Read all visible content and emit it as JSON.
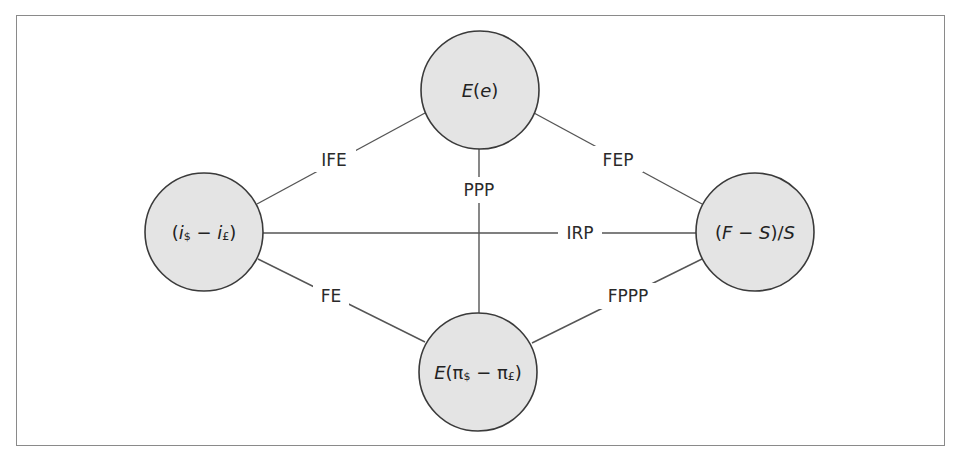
{
  "diagram": {
    "nodes": {
      "top": {
        "label": "E(e)",
        "parts": {
          "func": "E",
          "open": "(",
          "var": "e",
          "close": ")"
        }
      },
      "left": {
        "label": "(i$ − i£)",
        "parts": {
          "open": "(",
          "var1": "i",
          "sub1": "$",
          "minus": " − ",
          "var2": "i",
          "sub2": "£",
          "close": ")"
        }
      },
      "right": {
        "label": "(F − S)/S",
        "parts": {
          "open": "(",
          "var1": "F",
          "minus": " − ",
          "var2": "S",
          "close": ")/",
          "var3": "S"
        }
      },
      "bottom": {
        "label": "E(π$ − π£)",
        "parts": {
          "func": "E",
          "open": "(",
          "var1": "π",
          "sub1": "$",
          "minus": " − ",
          "var2": "π",
          "sub2": "£",
          "close": ")"
        }
      }
    },
    "edges": {
      "ife": {
        "label": "IFE",
        "from": "left",
        "to": "top"
      },
      "fep": {
        "label": "FEP",
        "from": "top",
        "to": "right"
      },
      "ppp": {
        "label": "PPP",
        "from": "top",
        "to": "bottom"
      },
      "irp": {
        "label": "IRP",
        "from": "left",
        "to": "right"
      },
      "fe": {
        "label": "FE",
        "from": "left",
        "to": "bottom"
      },
      "fppp": {
        "label": "FPPP",
        "from": "bottom",
        "to": "right"
      }
    },
    "colors": {
      "node_fill": "#e4e4e4",
      "node_stroke": "#3a3a3a",
      "edge": "#555555",
      "frame": "#8a8a8a",
      "text": "#222222"
    }
  }
}
